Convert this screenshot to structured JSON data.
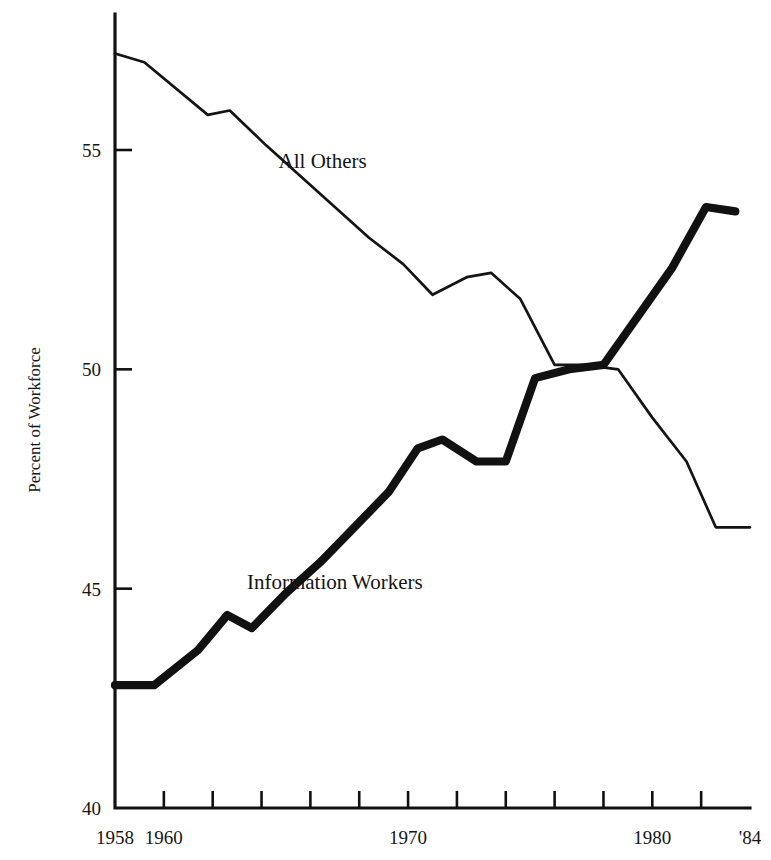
{
  "chart_data": {
    "type": "line",
    "title": "",
    "subtitle": "",
    "xlabel": "",
    "ylabel": "Percent of Workforce",
    "xlim": [
      1958,
      1984
    ],
    "ylim": [
      40,
      56
    ],
    "grid": false,
    "legend_position": "inline-annotation",
    "x_tick_values": [
      1958,
      1960,
      1962,
      1964,
      1966,
      1968,
      1970,
      1972,
      1974,
      1976,
      1978,
      1980,
      1982,
      1984
    ],
    "x_tick_labels": [
      "1958",
      "1960",
      "",
      "",
      "",
      "",
      "1970",
      "",
      "",
      "",
      "",
      "1980",
      "",
      "'84"
    ],
    "y_tick_values": [
      40,
      45,
      50,
      55
    ],
    "y_tick_labels": [
      "40",
      "45",
      "50",
      "55"
    ],
    "annotations": [
      {
        "text": "All Others",
        "x": 1966.5,
        "y": 54.6
      },
      {
        "text": "Information Workers",
        "x": 1967.0,
        "y": 45.0
      }
    ],
    "series": [
      {
        "name": "All Others",
        "style": "thin",
        "x": [
          1958.0,
          1959.2,
          1961.8,
          1962.7,
          1964.2,
          1965.6,
          1967.0,
          1968.4,
          1969.8,
          1971.0,
          1972.4,
          1973.4,
          1974.6,
          1976.0,
          1977.2,
          1978.6,
          1980.0,
          1981.4,
          1982.6,
          1984.0
        ],
        "values": [
          57.2,
          57.0,
          55.8,
          55.9,
          55.1,
          54.4,
          53.7,
          53.0,
          52.4,
          51.7,
          52.1,
          52.2,
          51.6,
          50.1,
          50.1,
          50.0,
          48.9,
          47.9,
          46.4,
          46.4
        ],
        "ylabel_unit": "percent"
      },
      {
        "name": "Information Workers",
        "style": "bold",
        "x": [
          1958.0,
          1959.6,
          1961.4,
          1962.6,
          1963.6,
          1965.0,
          1966.4,
          1967.8,
          1969.2,
          1970.4,
          1971.4,
          1972.8,
          1974.0,
          1975.2,
          1976.6,
          1978.0,
          1979.4,
          1980.8,
          1982.2,
          1983.4
        ],
        "values": [
          42.8,
          42.8,
          43.6,
          44.4,
          44.1,
          44.9,
          45.6,
          46.4,
          47.2,
          48.2,
          48.4,
          47.9,
          47.9,
          49.8,
          50.0,
          50.1,
          51.2,
          52.3,
          53.7,
          53.6
        ],
        "ylabel_unit": "percent"
      }
    ]
  },
  "colors": {
    "background": "#ffffff",
    "ink": "#141414",
    "axis": "#111111"
  },
  "axis": {
    "y_title": "Percent of Workforce"
  }
}
